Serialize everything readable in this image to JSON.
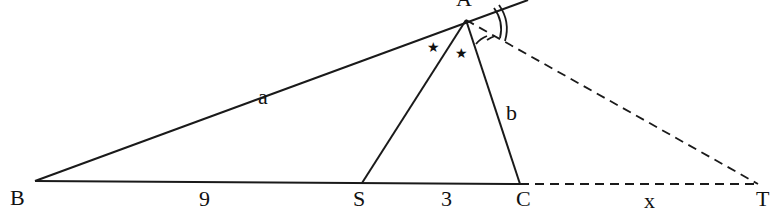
{
  "diagram": {
    "type": "triangle-angle-bisector",
    "vertices": {
      "A": {
        "label": "A"
      },
      "B": {
        "label": "B"
      },
      "C": {
        "label": "C"
      },
      "S": {
        "label": "S"
      },
      "T": {
        "label": "T"
      }
    },
    "side_labels": {
      "AB": "a",
      "AC": "b",
      "BS": "9",
      "SC": "3",
      "CT": "x"
    },
    "angle_marks": {
      "interior_bisector": "★",
      "exterior_bisector": "double-arc"
    },
    "colors": {
      "stroke": "#1a1a1a",
      "background": "#ffffff"
    }
  }
}
